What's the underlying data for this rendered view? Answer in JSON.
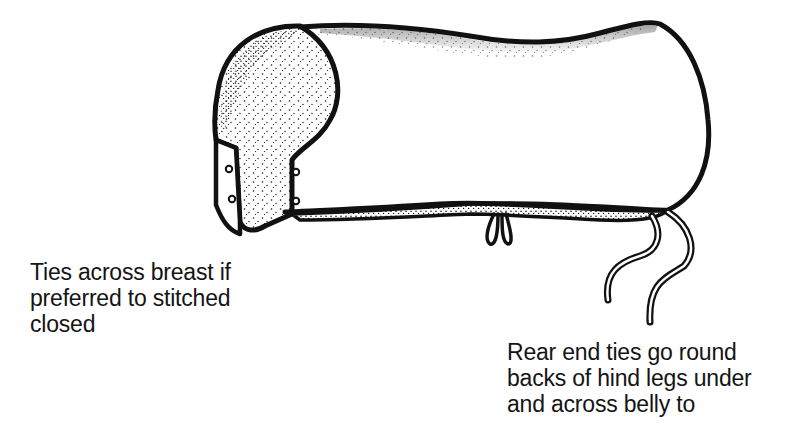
{
  "figure": {
    "ink_color": "#111111",
    "paper_color": "#ffffff"
  },
  "captions": {
    "breast_ties": {
      "lines": [
        "Ties across breast if",
        "preferred to stitched",
        "closed"
      ]
    },
    "rear_ties": {
      "lines": [
        "Rear end ties go round",
        "backs of hind legs under",
        "and across belly to"
      ]
    }
  },
  "parts": {
    "front_panel_fasteners": 4,
    "belly_tie_loops": 2,
    "rear_tie_strings": 2
  }
}
